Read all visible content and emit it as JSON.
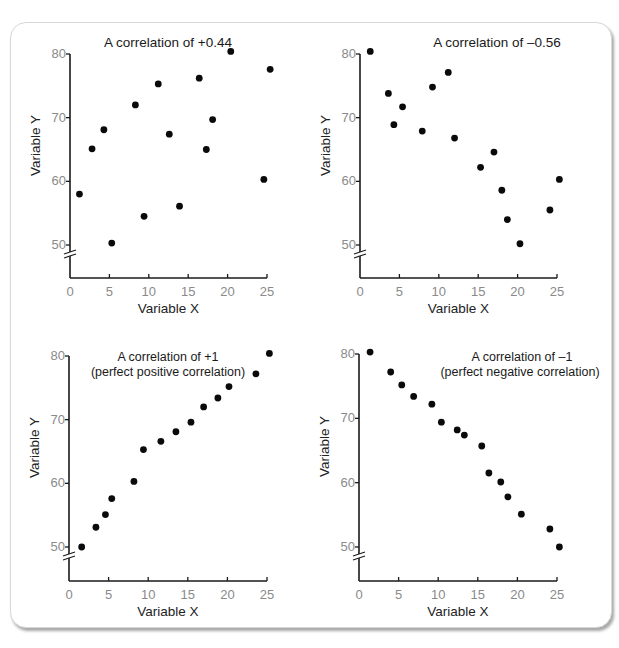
{
  "chart_data": [
    {
      "type": "scatter",
      "title": "A correlation of +0.44",
      "xlabel": "Variable X",
      "ylabel": "Variable Y",
      "xlim": [
        0,
        25
      ],
      "ylim": [
        50,
        80
      ],
      "xticks": [
        0,
        5,
        10,
        15,
        20,
        25
      ],
      "yticks": [
        50,
        60,
        70,
        80
      ],
      "y_axis_break": true,
      "grid": false,
      "points": [
        {
          "x": 1.2,
          "y": 58.0
        },
        {
          "x": 2.8,
          "y": 65.1
        },
        {
          "x": 4.3,
          "y": 68.1
        },
        {
          "x": 5.3,
          "y": 50.3
        },
        {
          "x": 8.3,
          "y": 72.0
        },
        {
          "x": 9.4,
          "y": 54.5
        },
        {
          "x": 11.2,
          "y": 75.3
        },
        {
          "x": 12.6,
          "y": 67.4
        },
        {
          "x": 13.9,
          "y": 56.1
        },
        {
          "x": 16.4,
          "y": 76.2
        },
        {
          "x": 17.3,
          "y": 65.0
        },
        {
          "x": 18.1,
          "y": 69.7
        },
        {
          "x": 20.4,
          "y": 80.4
        },
        {
          "x": 24.6,
          "y": 60.3
        },
        {
          "x": 25.4,
          "y": 77.6
        }
      ]
    },
    {
      "type": "scatter",
      "title": "A correlation of –0.56",
      "xlabel": "Variable X",
      "ylabel": "Variable Y",
      "xlim": [
        0,
        25
      ],
      "ylim": [
        50,
        80
      ],
      "xticks": [
        0,
        5,
        10,
        15,
        20,
        25
      ],
      "yticks": [
        50,
        60,
        70,
        80
      ],
      "y_axis_break": true,
      "grid": false,
      "points": [
        {
          "x": 1.3,
          "y": 80.4
        },
        {
          "x": 3.6,
          "y": 73.8
        },
        {
          "x": 4.3,
          "y": 68.9
        },
        {
          "x": 5.4,
          "y": 71.7
        },
        {
          "x": 7.9,
          "y": 67.9
        },
        {
          "x": 9.2,
          "y": 74.8
        },
        {
          "x": 11.2,
          "y": 77.1
        },
        {
          "x": 12.0,
          "y": 66.8
        },
        {
          "x": 15.3,
          "y": 62.2
        },
        {
          "x": 17.0,
          "y": 64.6
        },
        {
          "x": 18.0,
          "y": 58.6
        },
        {
          "x": 18.7,
          "y": 54.0
        },
        {
          "x": 20.3,
          "y": 50.2
        },
        {
          "x": 24.1,
          "y": 55.5
        },
        {
          "x": 25.3,
          "y": 60.3
        }
      ]
    },
    {
      "type": "scatter",
      "title": "A correlation of +1",
      "subtitle": "(perfect positive correlation)",
      "xlabel": "Variable X",
      "ylabel": "Variable Y",
      "xlim": [
        0,
        25
      ],
      "ylim": [
        50,
        80
      ],
      "xticks": [
        0,
        5,
        10,
        15,
        20,
        25
      ],
      "yticks": [
        50,
        60,
        70,
        80
      ],
      "y_axis_break": true,
      "grid": false,
      "points": [
        {
          "x": 1.6,
          "y": 50.0
        },
        {
          "x": 3.4,
          "y": 53.1
        },
        {
          "x": 4.6,
          "y": 55.1
        },
        {
          "x": 5.4,
          "y": 57.6
        },
        {
          "x": 8.2,
          "y": 60.3
        },
        {
          "x": 9.4,
          "y": 65.3
        },
        {
          "x": 11.6,
          "y": 66.6
        },
        {
          "x": 13.5,
          "y": 68.1
        },
        {
          "x": 15.4,
          "y": 69.6
        },
        {
          "x": 17.0,
          "y": 72.0
        },
        {
          "x": 18.8,
          "y": 73.4
        },
        {
          "x": 20.2,
          "y": 75.2
        },
        {
          "x": 23.6,
          "y": 77.2
        },
        {
          "x": 25.3,
          "y": 80.4
        }
      ]
    },
    {
      "type": "scatter",
      "title": "A correlation of –1",
      "subtitle": "(perfect negative correlation)",
      "xlabel": "Variable X",
      "ylabel": "Variable Y",
      "xlim": [
        0,
        25
      ],
      "ylim": [
        50,
        80
      ],
      "xticks": [
        0,
        5,
        10,
        15,
        20,
        25
      ],
      "yticks": [
        50,
        60,
        70,
        80
      ],
      "y_axis_break": true,
      "grid": false,
      "points": [
        {
          "x": 1.4,
          "y": 80.3
        },
        {
          "x": 4.0,
          "y": 77.2
        },
        {
          "x": 5.4,
          "y": 75.2
        },
        {
          "x": 6.9,
          "y": 73.4
        },
        {
          "x": 9.2,
          "y": 72.2
        },
        {
          "x": 10.4,
          "y": 69.4
        },
        {
          "x": 12.4,
          "y": 68.2
        },
        {
          "x": 13.3,
          "y": 67.4
        },
        {
          "x": 15.5,
          "y": 65.7
        },
        {
          "x": 16.4,
          "y": 61.5
        },
        {
          "x": 17.9,
          "y": 60.1
        },
        {
          "x": 18.8,
          "y": 57.8
        },
        {
          "x": 20.5,
          "y": 55.1
        },
        {
          "x": 24.1,
          "y": 52.8
        },
        {
          "x": 25.3,
          "y": 50.0
        }
      ]
    }
  ]
}
